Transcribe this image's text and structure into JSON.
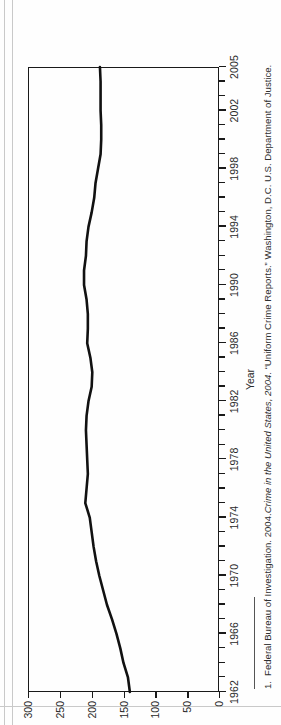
{
  "figure": {
    "axis_title_x": "Year",
    "footnote_marker": "1.",
    "footnote_part1": "Federal Bureau of Investigation. 2004.",
    "footnote_italic": "Crime in the United States, 2004",
    "footnote_part2": ". “Uniform Crime Reports.” Washington, D.C. U.S. Department of Justice.",
    "line_color": "#111111",
    "axis_color": "#1a1a1a"
  },
  "chart_data": {
    "type": "line",
    "title": "",
    "subtitle": "",
    "xlabel": "Year",
    "ylabel": "",
    "xlim": [
      1962,
      2005
    ],
    "ylim": [
      0,
      300
    ],
    "grid": false,
    "legend": null,
    "orientation": "rotated-90-ccw",
    "xticks": [
      1962,
      1966,
      1970,
      1974,
      1978,
      1982,
      1986,
      1990,
      1994,
      1998,
      2002,
      2005
    ],
    "xtick_labels": [
      "1962",
      "1966",
      "1970",
      "1974",
      "1978",
      "1982",
      "1986",
      "1990",
      "1994",
      "1998",
      "2002",
      "2005"
    ],
    "yticks": [
      0,
      50,
      100,
      150,
      200,
      250,
      300
    ],
    "ytick_labels": [
      "0",
      "50",
      "100",
      "150",
      "200",
      "250",
      "300"
    ],
    "x": [
      1962,
      1963,
      1964,
      1965,
      1966,
      1967,
      1968,
      1969,
      1970,
      1971,
      1972,
      1973,
      1974,
      1975,
      1976,
      1977,
      1978,
      1979,
      1980,
      1981,
      1982,
      1983,
      1984,
      1985,
      1986,
      1987,
      1988,
      1989,
      1990,
      1991,
      1992,
      1993,
      1994,
      1995,
      1996,
      1997,
      1998,
      1999,
      2000,
      2001,
      2002,
      2003,
      2004,
      2005
    ],
    "series": [
      {
        "name": "Rate",
        "values": [
          140,
          143,
          150,
          155,
          161,
          168,
          176,
          182,
          188,
          193,
          197,
          200,
          203,
          210,
          208,
          206,
          207,
          208,
          209,
          208,
          205,
          200,
          199,
          202,
          207,
          206,
          206,
          208,
          212,
          212,
          209,
          208,
          205,
          200,
          196,
          194,
          190,
          186,
          185,
          185,
          186,
          186,
          186,
          187
        ]
      }
    ]
  }
}
